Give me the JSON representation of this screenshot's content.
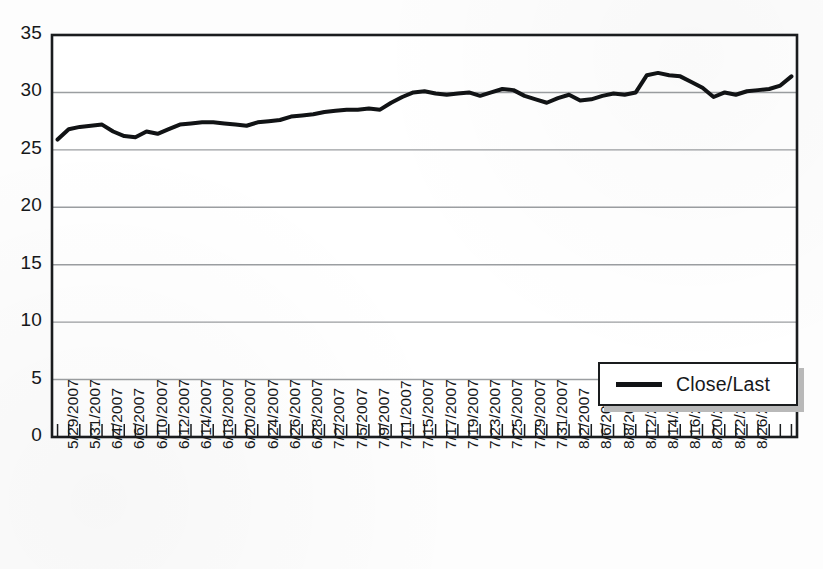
{
  "chart_data": {
    "type": "line",
    "title": "",
    "xlabel": "",
    "ylabel": "",
    "ylim": [
      0,
      35
    ],
    "ytick_step": 5,
    "ytick_labels": [
      "35",
      "30",
      "25",
      "20",
      "15",
      "10",
      "5",
      "0"
    ],
    "ytick_values": [
      35,
      30,
      25,
      20,
      15,
      10,
      5,
      0
    ],
    "grid": "horizontal",
    "legend_position": "inside-lower-right",
    "legend_entries": [
      "Close/Last"
    ],
    "series": [
      {
        "name": "Close/Last",
        "color": "#111315",
        "line_width": 4,
        "values": [
          25.9,
          26.8,
          27.0,
          27.1,
          27.2,
          26.6,
          26.2,
          26.1,
          26.6,
          26.4,
          26.8,
          27.2,
          27.3,
          27.4,
          27.4,
          27.3,
          27.2,
          27.1,
          27.4,
          27.5,
          27.6,
          27.9,
          28.0,
          28.1,
          28.3,
          28.4,
          28.5,
          28.5,
          28.6,
          28.5,
          29.1,
          29.6,
          30.0,
          30.1,
          29.9,
          29.8,
          29.9,
          30.0,
          29.7,
          30.0,
          30.3,
          30.2,
          29.7,
          29.4,
          29.1,
          29.5,
          29.8,
          29.3,
          29.4,
          29.7,
          29.9,
          29.8,
          30.0,
          31.5,
          31.7,
          31.5,
          31.4,
          30.9,
          30.4,
          29.6,
          30.0,
          29.8,
          30.1,
          30.2,
          30.3,
          30.6,
          31.4
        ],
        "x_labels": [
          "5/29/2007",
          "5/30/2007",
          "5/31/2007",
          "6/1/2007",
          "6/4/2007",
          "6/5/2007",
          "6/6/2007",
          "6/7/2007",
          "6/10/2007",
          "6/11/2007",
          "6/12/2007",
          "6/13/2007",
          "6/14/2007",
          "6/15/2007",
          "6/18/2007",
          "6/19/2007",
          "6/20/2007",
          "6/21/2007",
          "6/24/2007",
          "6/25/2007",
          "6/26/2007",
          "6/27/2007",
          "6/28/2007",
          "6/29/2007",
          "7/2/2007",
          "7/3/2007",
          "7/5/2007",
          "7/6/2007",
          "7/9/2007",
          "7/10/2007",
          "7/11/2007",
          "7/12/2007",
          "7/15/2007",
          "7/16/2007",
          "7/17/2007",
          "7/18/2007",
          "7/19/2007",
          "7/20/2007",
          "7/23/2007",
          "7/24/2007",
          "7/25/2007",
          "7/26/2007",
          "7/29/2007",
          "7/30/2007",
          "7/31/2007",
          "8/1/2007",
          "8/2/2007",
          "8/3/2007",
          "8/6/2007",
          "8/7/2007",
          "8/8/2007",
          "8/9/2007",
          "8/12/2007",
          "8/13/2007",
          "8/14/2007",
          "8/15/2007",
          "8/16/2007",
          "8/17/2007",
          "8/20/2007",
          "8/21/2007",
          "8/22/2007",
          "8/23/2007",
          "8/26/2007",
          "8/27/2007",
          "8/28/2007",
          "8/29/2007",
          "8/30/2007"
        ],
        "visible_x_tick_labels": [
          "5/29/2007",
          "5/31/2007",
          "6/4/2007",
          "6/6/2007",
          "6/10/2007",
          "6/12/2007",
          "6/14/2007",
          "6/18/2007",
          "6/20/2007",
          "6/24/2007",
          "6/26/2007",
          "6/28/2007",
          "7/2/2007",
          "7/5/2007",
          "7/9/2007",
          "7/11/2007",
          "7/15/2007",
          "7/17/2007",
          "7/19/2007",
          "7/23/2007",
          "7/25/2007",
          "7/29/2007",
          "7/31/2007",
          "8/2/2007",
          "8/6/2007",
          "8/8/2007",
          "8/12/2007",
          "8/14/2007",
          "8/16/2007",
          "8/20/2007",
          "8/22/2007",
          "8/26/2007"
        ]
      }
    ],
    "axis_color": "#1a1c1e",
    "gridline_color": "#9b9ea1",
    "plot_background": "#ffffff"
  },
  "legend": {
    "label": "Close/Last"
  }
}
